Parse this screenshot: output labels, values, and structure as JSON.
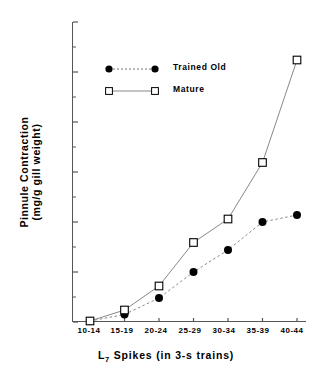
{
  "chart_data": {
    "type": "line",
    "title": "",
    "xlabel": "L 7 Spikes (in 3-s trains)",
    "xlabel_main": "L",
    "xlabel_sub": "7",
    "xlabel_rest": " Spikes (in 3-s trains)",
    "ylabel_line1": "Pinnule  Contraction",
    "ylabel_line2": "(mg/g  gill  weight)",
    "categories": [
      "10-14",
      "15-19",
      "20-24",
      "25-29",
      "30-34",
      "35-39",
      "40-44"
    ],
    "ylim": [
      0,
      600
    ],
    "yticks": [
      0,
      100,
      200,
      300,
      400,
      500,
      600
    ],
    "ytick_labels": [
      "0",
      "100",
      "200",
      "300",
      "400",
      "500",
      "600"
    ],
    "minor_yticks": [
      50,
      150,
      250,
      350,
      450,
      550
    ],
    "grid": false,
    "legend_position": "upper-left-inside",
    "series": [
      {
        "name": "Trained Old",
        "values": [
          2,
          15,
          48,
          100,
          144,
          200,
          214
        ],
        "marker": "filled-circle",
        "linestyle": "dashed",
        "color": "#000000"
      },
      {
        "name": "Mature",
        "values": [
          2,
          24,
          72,
          159,
          206,
          319,
          524
        ],
        "marker": "open-square",
        "linestyle": "solid",
        "color": "#000000"
      }
    ]
  },
  "legend": {
    "items": [
      {
        "label": "Trained Old",
        "marker": "filled-circle",
        "linestyle": "dashed"
      },
      {
        "label": "Mature",
        "marker": "open-square",
        "linestyle": "solid"
      }
    ]
  },
  "colors": {
    "axis": "#555555",
    "line": "#888888",
    "marker_fill": "#000000",
    "marker_open": "#ffffff",
    "text": "#000000"
  }
}
